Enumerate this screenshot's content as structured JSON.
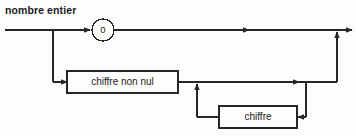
{
  "diagram": {
    "type": "syntax-railroad-diagram",
    "title": "nombre entier",
    "language": "fr",
    "nodes": [
      {
        "id": "zero",
        "shape": "circle",
        "label": "0",
        "kind": "terminal"
      },
      {
        "id": "chiffre-non-nul",
        "shape": "rectangle",
        "label": "chiffre non nul",
        "kind": "nonterminal"
      },
      {
        "id": "chiffre",
        "shape": "rectangle",
        "label": "chiffre",
        "kind": "nonterminal"
      }
    ],
    "colors": {
      "line": "#262626",
      "text": "#1a1a1a",
      "box_fill": "#fdfdfb",
      "background": "#ffffff"
    }
  }
}
